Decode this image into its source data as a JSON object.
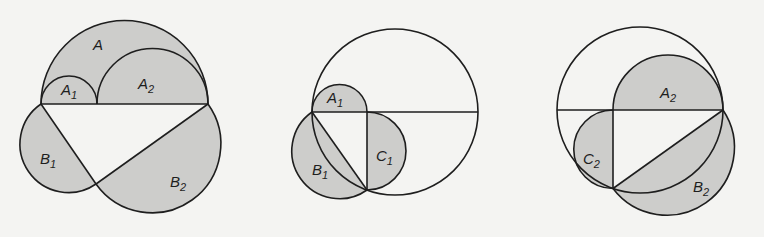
{
  "diagram": {
    "fill_color": "#cdcdcb",
    "stroke_color": "#1e1e1e",
    "background": "#f4f4f2",
    "figures": [
      {
        "name": "figure-1",
        "labels": {
          "A": {
            "base": "A",
            "sub": ""
          },
          "A1": {
            "base": "A",
            "sub": "1"
          },
          "A2": {
            "base": "A",
            "sub": "2"
          },
          "B1": {
            "base": "B",
            "sub": "1"
          },
          "B2": {
            "base": "B",
            "sub": "2"
          }
        }
      },
      {
        "name": "figure-2",
        "labels": {
          "A1": {
            "base": "A",
            "sub": "1"
          },
          "B1": {
            "base": "B",
            "sub": "1"
          },
          "C1": {
            "base": "C",
            "sub": "1"
          }
        }
      },
      {
        "name": "figure-3",
        "labels": {
          "A2": {
            "base": "A",
            "sub": "2"
          },
          "B2": {
            "base": "B",
            "sub": "2"
          },
          "C2": {
            "base": "C",
            "sub": "2"
          }
        }
      }
    ]
  }
}
